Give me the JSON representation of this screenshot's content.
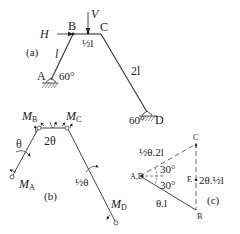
{
  "figure_a": {
    "tag": "(a)",
    "nodes": {
      "A": "A",
      "B": "B",
      "C": "C",
      "D": "D"
    },
    "loads": {
      "horizontal": "H",
      "vertical": "V"
    },
    "lengths": {
      "AB": "l",
      "BC": "½l",
      "CD": "2l"
    },
    "angles": {
      "at_A": "60°",
      "at_D": "60°"
    }
  },
  "figure_b": {
    "tag": "(b)",
    "moments": {
      "A": "M",
      "A_sub": "A",
      "B": "M",
      "B_sub": "B",
      "C": "M",
      "C_sub": "C",
      "D": "M",
      "D_sub": "D"
    },
    "rotations": {
      "AB": "θ",
      "BC": "2θ",
      "CD": "½θ"
    }
  },
  "figure_c": {
    "tag": "(c)",
    "nodes": {
      "AD": "A,D",
      "B": "B",
      "C": "C",
      "E": "E"
    },
    "displacements": {
      "AD_C": "½θ.2l",
      "AD_B": "θ.l",
      "CB": "2θ.½l"
    },
    "angles": {
      "upper": "30°",
      "lower": "30°"
    }
  }
}
